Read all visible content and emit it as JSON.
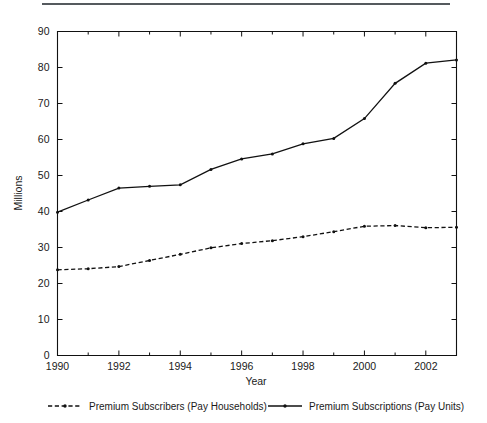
{
  "figure": {
    "top_rule": true,
    "background_color": "#ffffff",
    "line_color": "#111111"
  },
  "chart_data": {
    "type": "line",
    "title": "",
    "subtitle": "",
    "xlabel": "Year",
    "ylabel": "Millions",
    "xlim": [
      1990,
      2003
    ],
    "ylim": [
      0,
      90
    ],
    "grid": false,
    "legend_position": "bottom",
    "x": [
      1990,
      1991,
      1992,
      1993,
      1994,
      1995,
      1996,
      1997,
      1998,
      1999,
      2000,
      2001,
      2002,
      2003
    ],
    "xtick_labels": [
      "1990",
      "1992",
      "1994",
      "1996",
      "1998",
      "2000",
      "2002"
    ],
    "xticks": [
      1990,
      1992,
      1994,
      1996,
      1998,
      2000,
      2002
    ],
    "xticks_minor": [
      1991,
      1993,
      1995,
      1997,
      1999,
      2001,
      2003
    ],
    "ytick_labels": [
      "0",
      "10",
      "20",
      "30",
      "40",
      "50",
      "60",
      "70",
      "80",
      "90"
    ],
    "yticks": [
      0,
      10,
      20,
      30,
      40,
      50,
      60,
      70,
      80,
      90
    ],
    "series": [
      {
        "name": "Premium Subscribers (Pay Households)",
        "style": "dashed",
        "marker": "dot",
        "values": [
          23.8,
          24.1,
          24.7,
          26.4,
          28.1,
          29.9,
          31.1,
          31.9,
          33.0,
          34.4,
          35.9,
          36.1,
          35.5,
          35.6
        ]
      },
      {
        "name": "Premium Subscriptions (Pay Units)",
        "style": "solid",
        "marker": "dot",
        "values": [
          39.8,
          43.2,
          46.5,
          47.0,
          47.4,
          51.7,
          54.6,
          56.0,
          58.8,
          60.3,
          65.8,
          75.6,
          81.2,
          82.1
        ]
      }
    ]
  },
  "legend": {
    "items": [
      {
        "label": "Premium Subscribers (Pay Households)",
        "style": "dashed"
      },
      {
        "label": "Premium Subscriptions (Pay Units)",
        "style": "solid"
      }
    ]
  }
}
